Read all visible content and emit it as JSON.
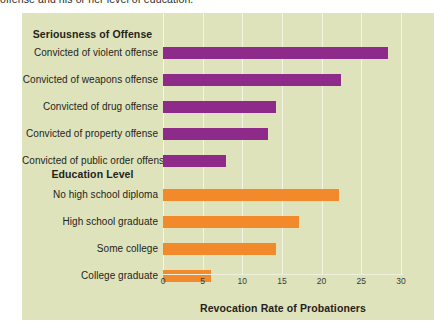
{
  "caption": {
    "text": "offense and his or her level of education."
  },
  "colors": {
    "panel_background": "#dfe3bb",
    "gridline": "#f3f5e4",
    "series_offense": "#8d2a8a",
    "series_education": "#f2892b",
    "text": "#231f20"
  },
  "axis": {
    "title": "Revocation Rate of  Probationers",
    "ticks": [
      "0",
      "5",
      "10",
      "15",
      "20",
      "25",
      "30"
    ]
  },
  "sections": {
    "offense_heading": "Seriousness of Offense",
    "education_heading": "Education Level"
  },
  "chart_data": {
    "type": "bar",
    "orientation": "horizontal",
    "title": "",
    "xlabel": "Revocation Rate of  Probationers",
    "ylabel": "",
    "xlim": [
      0,
      30
    ],
    "xticks": [
      0,
      5,
      10,
      15,
      20,
      25,
      30
    ],
    "grid": true,
    "legend": "none",
    "groups": [
      {
        "name": "Seriousness of Offense",
        "color": "#8d2a8a",
        "categories": [
          "Convicted of violent offense",
          "Convicted of weapons offense",
          "Convicted of drug offense",
          "Convicted of property offense",
          "Convicted of public order offense"
        ],
        "values": [
          28.4,
          22.4,
          14.2,
          13.2,
          8.0
        ]
      },
      {
        "name": "Education Level",
        "color": "#f2892b",
        "categories": [
          "No high school diploma",
          "High school graduate",
          "Some college",
          "College graduate"
        ],
        "values": [
          22.2,
          17.1,
          14.2,
          6.1
        ]
      }
    ]
  }
}
